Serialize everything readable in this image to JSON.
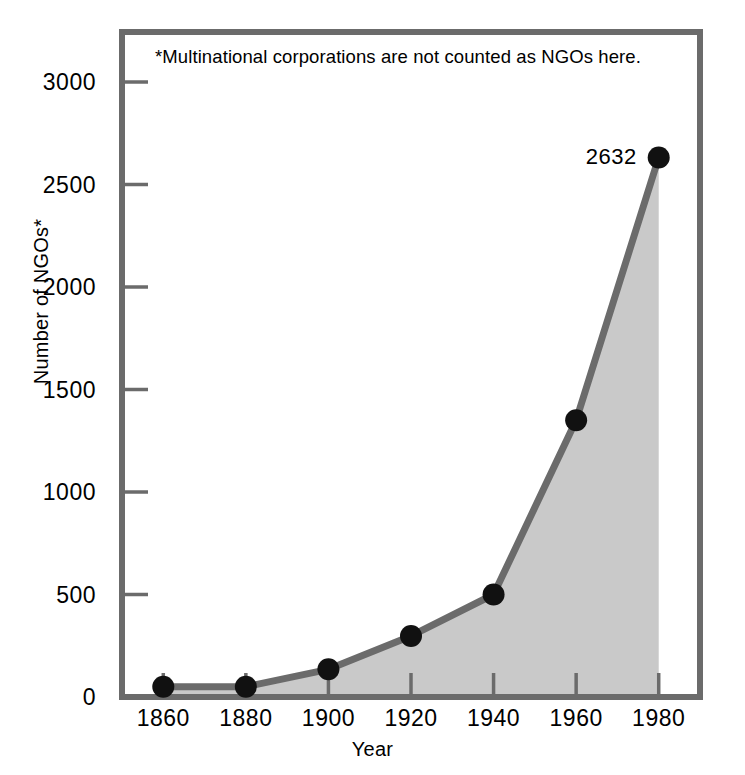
{
  "chart_data": {
    "type": "area",
    "title": "",
    "subtitle": "",
    "xlabel": "Year",
    "ylabel": "Number of NGOs*",
    "x": [
      1860,
      1880,
      1900,
      1920,
      1940,
      1960,
      1980
    ],
    "values": [
      50,
      50,
      135,
      298,
      500,
      1350,
      2632
    ],
    "series": [
      {
        "name": "Number of NGOs",
        "values": [
          50,
          50,
          135,
          298,
          500,
          1350,
          2632
        ]
      }
    ],
    "xlim": [
      1850,
      1990
    ],
    "ylim": [
      0,
      3150
    ],
    "xticks": [
      1860,
      1880,
      1900,
      1920,
      1940,
      1960,
      1980
    ],
    "xtick_labels": [
      "1860",
      "1880",
      "1900",
      "1920",
      "1940",
      "1960",
      "1980"
    ],
    "yticks": [
      0,
      500,
      1000,
      1500,
      2000,
      2500,
      3000
    ],
    "ytick_labels": [
      "0",
      "500",
      "1000",
      "1500",
      "2000",
      "2500",
      "3000"
    ],
    "grid": false,
    "legend": false,
    "legend_position": "none",
    "annotations": [
      {
        "name": "footnote",
        "text": "*Multinational corporations are not counted as NGOs here."
      }
    ],
    "data_labels": [
      {
        "name": "peak-value",
        "x": 1980,
        "y": 2632,
        "text": "2632"
      }
    ],
    "colors": {
      "line": "#6b6b6b",
      "fill": "#c9c9c9",
      "marker": "#111111",
      "axis": "#6b6b6b",
      "text": "#000000",
      "background": "#ffffff"
    }
  },
  "axes": {
    "y_title": "Number of NGOs*",
    "x_title": "Year"
  }
}
